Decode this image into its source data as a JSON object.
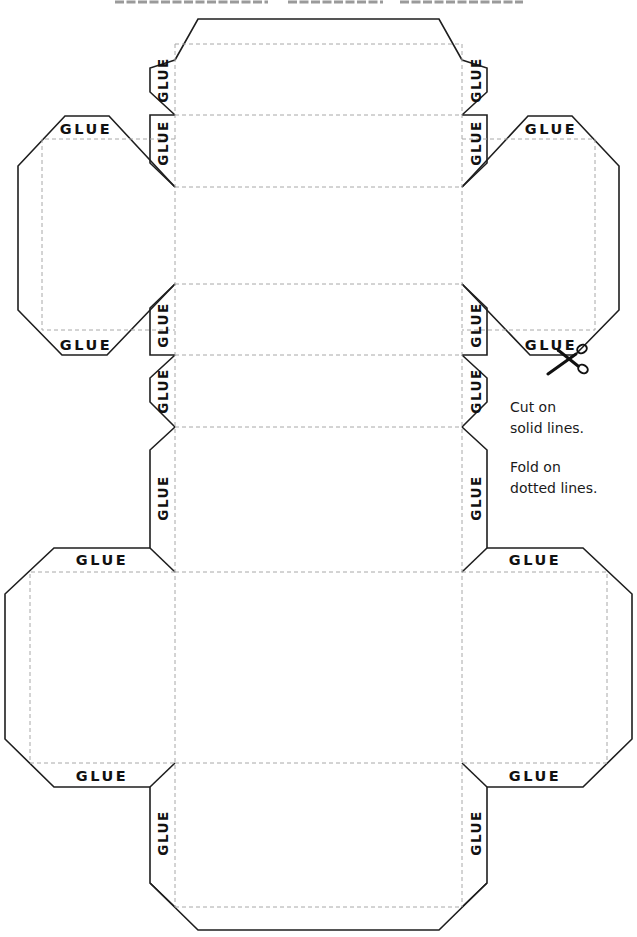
{
  "title": {
    "text_visible": false
  },
  "glue_label": "GLUE",
  "tabs": {
    "top_lid_left_top": "GLUE",
    "top_lid_left_bottom": "GLUE",
    "top_lid_right_top": "GLUE",
    "top_lid_right_bottom": "GLUE",
    "spine_left_1": "GLUE",
    "spine_left_2": "GLUE",
    "spine_left_3": "GLUE",
    "spine_left_4": "GLUE",
    "spine_left_5": "GLUE",
    "spine_left_6": "GLUE",
    "spine_right_1": "GLUE",
    "spine_right_2": "GLUE",
    "spine_right_3": "GLUE",
    "spine_right_4": "GLUE",
    "spine_right_5": "GLUE",
    "spine_right_6": "GLUE",
    "bottom_wing_left_top": "GLUE",
    "bottom_wing_left_bottom": "GLUE",
    "bottom_wing_right_top": "GLUE",
    "bottom_wing_right_bottom": "GLUE"
  },
  "instructions": {
    "cut_line1": "Cut on",
    "cut_line2": "solid lines.",
    "fold_line1": "Fold on",
    "fold_line2": "dotted lines."
  },
  "colors": {
    "cut_line": "#1e1e1e",
    "fold_line": "#a8a8a8",
    "text": "#111111",
    "background": "#ffffff"
  },
  "icons": {
    "scissors": "scissors-icon"
  }
}
